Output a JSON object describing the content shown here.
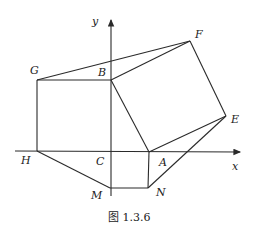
{
  "figure": {
    "caption": "图 1.3.6",
    "axes": {
      "x_label": "x",
      "y_label": "y"
    },
    "points": {
      "A": {
        "label": "A",
        "x": 149,
        "y": 152
      },
      "B": {
        "label": "B",
        "x": 111,
        "y": 80
      },
      "C": {
        "label": "C",
        "x": 111,
        "y": 151
      },
      "E": {
        "label": "E",
        "x": 226,
        "y": 116
      },
      "F": {
        "label": "F",
        "x": 190,
        "y": 41
      },
      "G": {
        "label": "G",
        "x": 37,
        "y": 80
      },
      "H": {
        "label": "H",
        "x": 37,
        "y": 151
      },
      "M": {
        "label": "M",
        "x": 110,
        "y": 188
      },
      "N": {
        "label": "N",
        "x": 148,
        "y": 188
      }
    },
    "segments": [
      "GB",
      "GH",
      "GF",
      "BF",
      "BA",
      "FE",
      "EA",
      "EN",
      "AN",
      "MN",
      "HM"
    ],
    "stroke_color": "#2a2a2a"
  }
}
